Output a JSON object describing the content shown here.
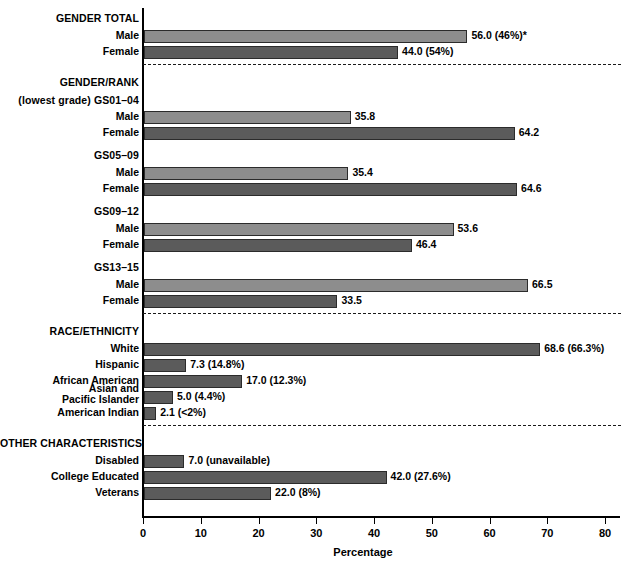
{
  "chart_data": {
    "type": "bar",
    "orientation": "horizontal",
    "title": "",
    "xlabel": "Percentage",
    "ylabel": "",
    "xlim": [
      0,
      85
    ],
    "xticks": [
      0,
      10,
      20,
      30,
      40,
      50,
      60,
      70,
      80
    ],
    "grid": false,
    "legend": null,
    "groups": [
      {
        "heading": "GENDER TOTAL",
        "rows": [
          {
            "label": "Male",
            "value": 56.0,
            "value_label": "56.0 (46%)*",
            "shade": "light"
          },
          {
            "label": "Female",
            "value": 44.0,
            "value_label": "44.0 (54%)",
            "shade": "dark"
          }
        ]
      },
      {
        "heading": "GENDER/RANK",
        "subheading": "(lowest grade) GS01–04",
        "rows": [
          {
            "label": "Male",
            "value": 35.8,
            "value_label": "35.8",
            "shade": "light"
          },
          {
            "label": "Female",
            "value": 64.2,
            "value_label": "64.2",
            "shade": "dark"
          }
        ]
      },
      {
        "heading": "GS05–09",
        "rows": [
          {
            "label": "Male",
            "value": 35.4,
            "value_label": "35.4",
            "shade": "light"
          },
          {
            "label": "Female",
            "value": 64.6,
            "value_label": "64.6",
            "shade": "dark"
          }
        ]
      },
      {
        "heading": "GS09–12",
        "rows": [
          {
            "label": "Male",
            "value": 53.6,
            "value_label": "53.6",
            "shade": "light"
          },
          {
            "label": "Female",
            "value": 46.4,
            "value_label": "46.4",
            "shade": "dark"
          }
        ]
      },
      {
        "heading": "GS13–15",
        "rows": [
          {
            "label": "Male",
            "value": 66.5,
            "value_label": "66.5",
            "shade": "light"
          },
          {
            "label": "Female",
            "value": 33.5,
            "value_label": "33.5",
            "shade": "dark"
          }
        ]
      },
      {
        "heading": "RACE/ETHNICITY",
        "rows": [
          {
            "label": "White",
            "value": 68.6,
            "value_label": "68.6 (66.3%)",
            "shade": "dark"
          },
          {
            "label": "Hispanic",
            "value": 7.3,
            "value_label": "7.3 (14.8%)",
            "shade": "dark"
          },
          {
            "label": "African American",
            "value": 17.0,
            "value_label": "17.0 (12.3%)",
            "shade": "dark"
          },
          {
            "label": "Asian and\nPacific Islander",
            "value": 5.0,
            "value_label": "5.0 (4.4%)",
            "shade": "dark"
          },
          {
            "label": "American Indian",
            "value": 2.1,
            "value_label": "2.1 (<2%)",
            "shade": "dark"
          }
        ]
      },
      {
        "heading": "OTHER CHARACTERISTICS",
        "rows": [
          {
            "label": "Disabled",
            "value": 7.0,
            "value_label": "7.0 (unavailable)",
            "shade": "dark"
          },
          {
            "label": "College Educated",
            "value": 42.0,
            "value_label": "42.0 (27.6%)",
            "shade": "dark"
          },
          {
            "label": "Veterans",
            "value": 22.0,
            "value_label": "22.0 (8%)",
            "shade": "dark"
          }
        ]
      }
    ],
    "colors": {
      "bar_light": "#8d8d8d",
      "bar_dark": "#5b5b5b",
      "bar_border": "#2b2b2b",
      "axis": "#000000",
      "separator": "#1a1a1a",
      "background": "#ffffff"
    }
  }
}
